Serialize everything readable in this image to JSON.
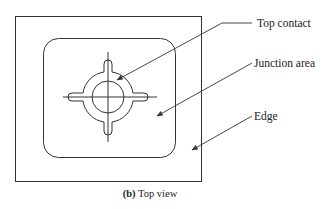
{
  "figure": {
    "caption_prefix": "(b)",
    "caption_text": " Top view",
    "labels": {
      "top_contact": "Top contact",
      "junction_area": "Junction area",
      "edge": "Edge"
    },
    "colors": {
      "stroke": "#333333",
      "background": "#ffffff",
      "text": "#222222"
    }
  }
}
